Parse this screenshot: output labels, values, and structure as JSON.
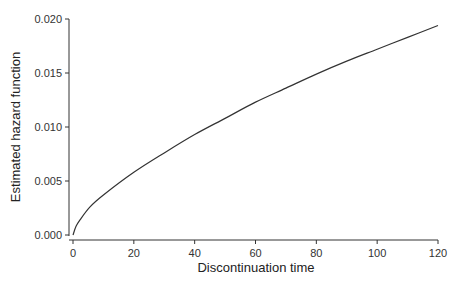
{
  "chart_data": {
    "type": "line",
    "title": "",
    "xlabel": "Discontinuation time",
    "ylabel": "Estimated hazard function",
    "xlim": [
      0,
      120
    ],
    "ylim": [
      0,
      0.02
    ],
    "grid": false,
    "legend": null,
    "x_ticks": [
      0,
      20,
      40,
      60,
      80,
      100,
      120
    ],
    "x_tick_labels": [
      "0",
      "20",
      "40",
      "60",
      "80",
      "100",
      "120"
    ],
    "y_ticks": [
      0.0,
      0.005,
      0.01,
      0.015,
      0.02
    ],
    "y_tick_labels": [
      "0.000",
      "0.005",
      "0.010",
      "0.015",
      "0.020"
    ],
    "series": [
      {
        "name": "Estimated hazard",
        "color": "#333333",
        "x": [
          0,
          1,
          2.3,
          5.6,
          10,
          20,
          30,
          40,
          50,
          60,
          70,
          80,
          90,
          100,
          110,
          120
        ],
        "y": [
          0.0,
          0.0008,
          0.0014,
          0.0026,
          0.0037,
          0.0058,
          0.0076,
          0.0093,
          0.0108,
          0.0123,
          0.0136,
          0.0149,
          0.0161,
          0.0172,
          0.0183,
          0.0194
        ]
      }
    ]
  },
  "colors": {
    "axis": "#333333",
    "line": "#333333",
    "background": "#ffffff"
  }
}
